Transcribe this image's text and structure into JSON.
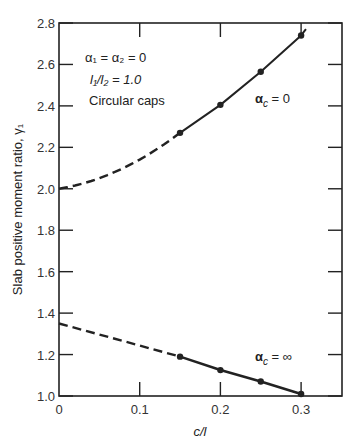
{
  "chart_data": {
    "type": "line",
    "title": "",
    "xlabel": "c/l",
    "ylabel": "Slab positive moment ratio, γ1",
    "xlim": [
      0,
      0.35
    ],
    "ylim": [
      1.0,
      2.8
    ],
    "x_ticks": [
      "0",
      "0.1",
      "0.2",
      "0.3"
    ],
    "y_ticks": [
      "1.0",
      "1.2",
      "1.4",
      "1.6",
      "1.8",
      "2.0",
      "2.2",
      "2.4",
      "2.6",
      "2.8"
    ],
    "grid": false,
    "annotations": {
      "conditions": [
        "α1 = α2 = 0",
        "l1/l2 = 1.0",
        "Circular caps"
      ]
    },
    "series": [
      {
        "name": "αc = 0",
        "label": "αc = 0",
        "extrapolated_dashed": {
          "x": [
            0,
            0.05,
            0.1,
            0.15
          ],
          "y": [
            2.0,
            2.05,
            2.14,
            2.27
          ]
        },
        "x": [
          0.15,
          0.2,
          0.25,
          0.3
        ],
        "y": [
          2.27,
          2.405,
          2.565,
          2.74
        ]
      },
      {
        "name": "αc = ∞",
        "label": "αc = ∞",
        "extrapolated_dashed": {
          "x": [
            0,
            0.15
          ],
          "y": [
            1.35,
            1.19
          ]
        },
        "x": [
          0.15,
          0.2,
          0.25,
          0.3
        ],
        "y": [
          1.19,
          1.125,
          1.07,
          1.01
        ]
      }
    ]
  },
  "labels": {
    "ann1": "α",
    "ann1_full": "α₁ = α₂ = 0",
    "ann2": "l₁/l₂ = 1.0",
    "ann3": "Circular caps",
    "series1": "α",
    "series1_sub": "c",
    "series1_rest": " = 0",
    "series2": "α",
    "series2_sub": "c",
    "series2_rest": " = ∞",
    "xlabel": "c/l",
    "ylabel": "Slab positive moment ratio, γ₁"
  }
}
